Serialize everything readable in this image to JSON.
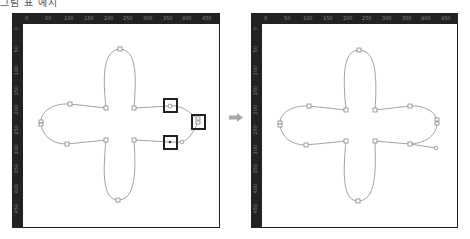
{
  "caption": "그림 표 예시",
  "ruler": {
    "horizontal_labels": [
      "0",
      "50",
      "100",
      "150",
      "200",
      "250",
      "300",
      "350",
      "400",
      "450"
    ],
    "vertical_labels": [
      "0",
      "50",
      "100",
      "150",
      "200",
      "250",
      "300",
      "350",
      "400",
      "450"
    ]
  },
  "colors": {
    "ruler_bg": "#222222",
    "ruler_text": "#888888",
    "canvas_bg": "#ffffff",
    "path_stroke": "#8a8a8a",
    "anchor_fill": "#ffffff",
    "anchor_stroke": "#777777",
    "highlight_stroke": "#222222",
    "arrow_fill": "#a8a8a8"
  },
  "panels": [
    {
      "id": "before",
      "label": "before-editing",
      "highlighted_points": 3,
      "note": "Right lobe anchor points highlighted with bold boxes"
    },
    {
      "id": "after",
      "label": "after-editing",
      "highlighted_points": 0
    }
  ],
  "arrow": {
    "direction": "right",
    "icon": "arrow-right-icon"
  }
}
